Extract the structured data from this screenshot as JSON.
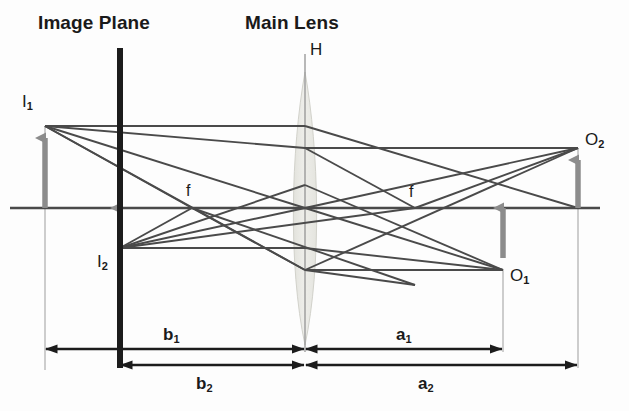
{
  "figure": {
    "type": "optics-ray-diagram",
    "title_left": "Image Plane",
    "title_right": "Main Lens",
    "principal_plane_label": "H",
    "focal_label_left": "f",
    "focal_label_right": "f",
    "points": {
      "image_1": {
        "base": "I",
        "sub": "1"
      },
      "image_2": {
        "base": "I",
        "sub": "2"
      },
      "object_1": {
        "base": "O",
        "sub": "1"
      },
      "object_2": {
        "base": "O",
        "sub": "2"
      }
    },
    "dimensions": [
      {
        "base": "b",
        "sub": "1"
      },
      {
        "base": "b",
        "sub": "2"
      },
      {
        "base": "a",
        "sub": "1"
      },
      {
        "base": "a",
        "sub": "2"
      }
    ],
    "colors": {
      "ray": "#4a4a4a",
      "arrow_gray": "#8c8c8c",
      "plane_black": "#1c1c1c",
      "lens_fill": "#ebebe6",
      "lens_stroke": "#cfcfc8",
      "text": "#1a1a1a",
      "background": "#fdfdfd"
    },
    "geometry": {
      "optical_axis_y": 208,
      "image_plane_x": 120,
      "lens_center_x": 305,
      "focal_left_x": 192,
      "focal_right_x": 415,
      "i1_x": 45,
      "i1_tip_y": 126,
      "i2_tip_y": 248,
      "o1_x": 503,
      "o1_tip_y": 270,
      "o2_x": 578,
      "o2_tip_y": 148
    }
  }
}
